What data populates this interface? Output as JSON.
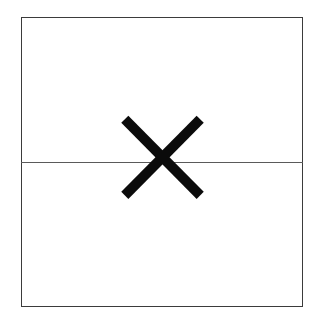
{
  "canvas": {
    "width": 325,
    "height": 328,
    "background_color": "#ffffff"
  },
  "field_box": {
    "label": "",
    "border_color": "#3b3b3b",
    "fill_color": "#ffffff",
    "x": 21,
    "y": 17,
    "width": 282,
    "height": 290
  },
  "divider": {
    "label": "",
    "color": "#5a5a5a",
    "y": 162,
    "x_start": 21,
    "x_end": 303
  },
  "mark": {
    "icon": "x-mark-icon",
    "symbol": "X",
    "color": "#0b0b0b",
    "stroke_width": 10,
    "center_x": 163,
    "center_y": 158,
    "bounds": {
      "left": 125,
      "top": 119,
      "right": 201,
      "bottom": 196
    },
    "strokes": [
      {
        "x1": 4.8,
        "y1": 5.2,
        "x2": 80.2,
        "y2": 81.4
      },
      {
        "x1": 80.2,
        "y1": 5.2,
        "x2": 4.8,
        "y2": 81.4
      }
    ]
  }
}
